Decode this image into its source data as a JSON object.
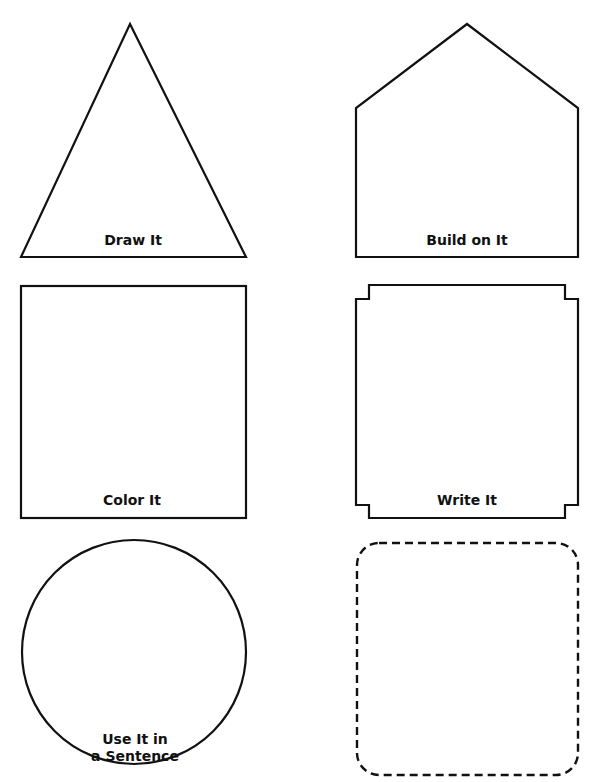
{
  "worksheet": {
    "stroke_color": "#111111",
    "background": "#ffffff",
    "panels": [
      {
        "id": "draw",
        "shape": "triangle",
        "label": "Draw It"
      },
      {
        "id": "build",
        "shape": "house-pentagon",
        "label": "Build on It"
      },
      {
        "id": "color",
        "shape": "square",
        "label": "Color It"
      },
      {
        "id": "write",
        "shape": "notched-rectangle",
        "label": "Write It"
      },
      {
        "id": "sentence",
        "shape": "circle",
        "label_line1": "Use It in",
        "label_line2": "a Sentence"
      },
      {
        "id": "blank",
        "shape": "dashed-rounded-rectangle",
        "label": ""
      }
    ]
  }
}
